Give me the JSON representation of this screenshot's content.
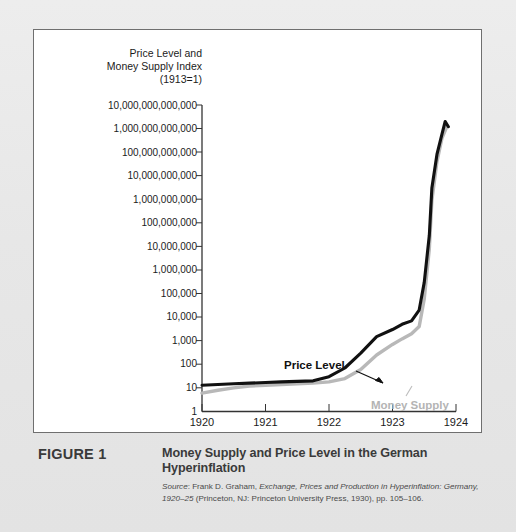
{
  "figure": {
    "label": "FIGURE 1",
    "title": "Money Supply and Price Level in the German Hyperinflation",
    "source_prefix": "Source",
    "source_author": ": Frank D. Graham, ",
    "source_work": "Exchange, Prices and Production in Hyperinflation: Germany,",
    "source_work2": "1920–25",
    "source_rest": " (Princeton, NJ: Princeton University Press, 1930), pp. 105–106."
  },
  "chart_data": {
    "type": "line",
    "title": "Price Level and Money Supply Index (1913=1)",
    "axis_title_lines": [
      "Price Level and",
      "Money Supply Index",
      "(1913=1)"
    ],
    "xlabel": "",
    "ylabel": "Price Level and Money Supply Index (1913=1)",
    "yscale": "log",
    "ylim": [
      1,
      10000000000000
    ],
    "xlim": [
      1920,
      1924
    ],
    "grid": false,
    "legend": "inline-annotation",
    "ytick_labels": [
      "10,000,000,000,000",
      "1,000,000,000,000",
      "100,000,000,000",
      "10,000,000,000",
      "1,000,000,000",
      "100,000,000",
      "10,000,000",
      "1,000,000",
      "100,000",
      "10,000",
      "1,000",
      "100",
      "10",
      "1"
    ],
    "ytick_values": [
      10000000000000.0,
      1000000000000.0,
      100000000000.0,
      10000000000.0,
      1000000000.0,
      100000000.0,
      10000000.0,
      1000000.0,
      100000.0,
      10000.0,
      1000,
      100,
      10,
      1
    ],
    "xtick_labels": [
      "1920",
      "1921",
      "1922",
      "1923",
      "1924"
    ],
    "xtick_values": [
      1920,
      1921,
      1922,
      1923,
      1924
    ],
    "series": [
      {
        "name": "Price Level",
        "color": "#111111",
        "x": [
          1920.0,
          1920.25,
          1920.5,
          1920.75,
          1921.0,
          1921.25,
          1921.5,
          1921.75,
          1922.0,
          1922.25,
          1922.5,
          1922.75,
          1923.0,
          1923.15,
          1923.3,
          1923.42,
          1923.5,
          1923.58,
          1923.62,
          1923.7,
          1923.78,
          1923.83,
          1923.88
        ],
        "y": [
          13,
          14,
          15,
          16,
          17,
          18,
          19,
          20,
          30,
          70,
          300,
          1500,
          3000,
          5000,
          7000,
          20000,
          300000,
          30000000,
          3000000000,
          80000000000,
          600000000000,
          2000000000000,
          1200000000000
        ]
      },
      {
        "name": "Money Supply",
        "color": "#b8b8b8",
        "x": [
          1920.0,
          1920.25,
          1920.5,
          1920.75,
          1921.0,
          1921.25,
          1921.5,
          1921.75,
          1922.0,
          1922.25,
          1922.5,
          1922.75,
          1923.0,
          1923.15,
          1923.3,
          1923.42,
          1923.5,
          1923.58,
          1923.62,
          1923.7,
          1923.78,
          1923.85
        ],
        "y": [
          6,
          8,
          10,
          12,
          13,
          14,
          15,
          16,
          18,
          25,
          60,
          250,
          700,
          1200,
          2000,
          4000,
          60000,
          8000000,
          900000000,
          40000000000,
          400000000000,
          1100000000000
        ]
      }
    ],
    "annotations": [
      {
        "text": "Price Level",
        "color": "#111111"
      },
      {
        "text": "Money Supply",
        "color": "#b4b4b4"
      }
    ]
  }
}
